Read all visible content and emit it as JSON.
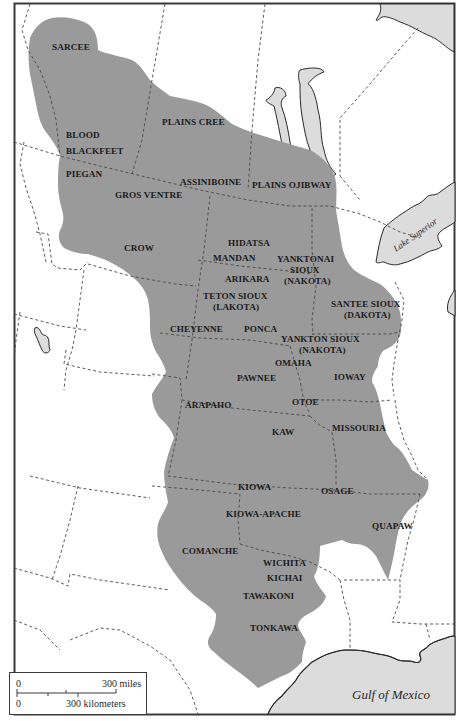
{
  "map": {
    "title": "Plains Indian Tribes",
    "colors": {
      "territory": "#9a9a9a",
      "water": "#dcdcdc",
      "background": "#ffffff",
      "border": "#4a4a4a",
      "text": "#1a1a1a"
    },
    "tribes": [
      {
        "name": "SARCEE",
        "x": 52,
        "y": 50
      },
      {
        "name": "PLAINS CREE",
        "x": 162,
        "y": 125
      },
      {
        "name": "BLOOD",
        "x": 66,
        "y": 138
      },
      {
        "name": "BLACKFEET",
        "x": 66,
        "y": 154
      },
      {
        "name": "PIEGAN",
        "x": 66,
        "y": 177
      },
      {
        "name": "ASSINIBOINE",
        "x": 180,
        "y": 185
      },
      {
        "name": "PLAINS OJIBWAY",
        "x": 252,
        "y": 188
      },
      {
        "name": "GROS VENTRE",
        "x": 115,
        "y": 198
      },
      {
        "name": "CROW",
        "x": 124,
        "y": 251
      },
      {
        "name": "HIDATSA",
        "x": 228,
        "y": 246
      },
      {
        "name": "MANDAN",
        "x": 213,
        "y": 261
      },
      {
        "name": "YANKTONAI",
        "x": 277,
        "y": 262
      },
      {
        "name": "SIOUX",
        "x": 290,
        "y": 273
      },
      {
        "name": "(NAKOTA)",
        "x": 284,
        "y": 284
      },
      {
        "name": "ARIKARA",
        "x": 225,
        "y": 282
      },
      {
        "name": "TETON SIOUX",
        "x": 203,
        "y": 299
      },
      {
        "name": "(LAKOTA)",
        "x": 213,
        "y": 310
      },
      {
        "name": "SANTEE SIOUX",
        "x": 331,
        "y": 307
      },
      {
        "name": "(DAKOTA)",
        "x": 344,
        "y": 318
      },
      {
        "name": "CHEYENNE",
        "x": 170,
        "y": 332
      },
      {
        "name": "PONCA",
        "x": 244,
        "y": 332
      },
      {
        "name": "YANKTON SIOUX",
        "x": 281,
        "y": 342
      },
      {
        "name": "(NAKOTA)",
        "x": 299,
        "y": 353
      },
      {
        "name": "OMAHA",
        "x": 275,
        "y": 366
      },
      {
        "name": "PAWNEE",
        "x": 237,
        "y": 381
      },
      {
        "name": "IOWAY",
        "x": 334,
        "y": 380
      },
      {
        "name": "ARAPAHO",
        "x": 185,
        "y": 408
      },
      {
        "name": "OTOE",
        "x": 292,
        "y": 405
      },
      {
        "name": "KAW",
        "x": 272,
        "y": 435
      },
      {
        "name": "MISSOURIA",
        "x": 332,
        "y": 431
      },
      {
        "name": "KIOWA",
        "x": 238,
        "y": 490
      },
      {
        "name": "OSAGE",
        "x": 321,
        "y": 494
      },
      {
        "name": "KIOWA-APACHE",
        "x": 226,
        "y": 517
      },
      {
        "name": "QUAPAW",
        "x": 372,
        "y": 529
      },
      {
        "name": "COMANCHE",
        "x": 182,
        "y": 554
      },
      {
        "name": "WICHITA",
        "x": 263,
        "y": 566
      },
      {
        "name": "KICHAI",
        "x": 267,
        "y": 581
      },
      {
        "name": "TAWAKONI",
        "x": 243,
        "y": 599
      },
      {
        "name": "TONKAWA",
        "x": 250,
        "y": 631
      }
    ],
    "water_bodies": [
      {
        "name": "Lake Superior",
        "x": 396,
        "y": 252,
        "rotate": -35,
        "size": 9
      },
      {
        "name": "Gulf of Mexico",
        "x": 352,
        "y": 699,
        "rotate": 0,
        "size": 13
      }
    ],
    "scale": {
      "zero_miles": "0",
      "miles_label": "300 miles",
      "zero_km": "0",
      "km_label": "300 kilometers"
    }
  }
}
